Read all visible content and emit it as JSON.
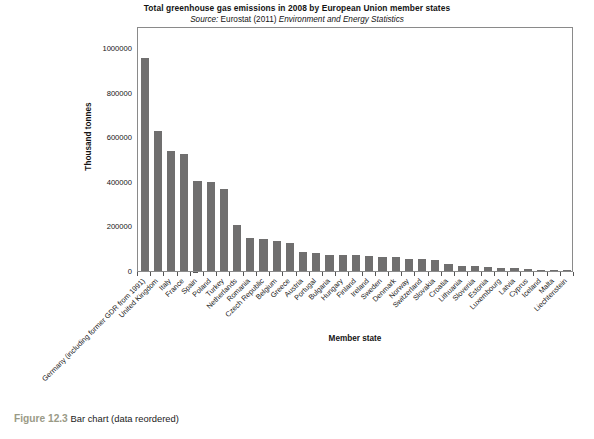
{
  "figure": {
    "caption_number": "Figure 12.3",
    "caption_text": "Bar chart (data reordered)"
  },
  "chart_data": {
    "type": "bar",
    "title": "Total greenhouse gas emissions in 2008 by European Union member states",
    "subtitle_prefix": "Source:",
    "subtitle_plain": " Eurostat (2011) ",
    "subtitle_italic": "Environment and Energy Statistics",
    "xlabel": "Member state",
    "ylabel": "Thousand tonnes",
    "ylim": [
      0,
      1100000
    ],
    "yticks": [
      0,
      200000,
      400000,
      600000,
      800000,
      1000000
    ],
    "ytick_labels": [
      "0",
      "200000",
      "400000",
      "600000",
      "800000",
      "1000000"
    ],
    "grid": false,
    "legend": null,
    "bar_color": "#706f6f",
    "categories": [
      "Germany (including former GDR from 1991)",
      "United Kingdom",
      "Italy",
      "France",
      "Spain",
      "Poland",
      "Turkey",
      "Netherlands",
      "Romania",
      "Czech Republic",
      "Belgium",
      "Greece",
      "Austria",
      "Portugal",
      "Bulgaria",
      "Hungary",
      "Finland",
      "Ireland",
      "Sweden",
      "Denmark",
      "Norway",
      "Switzerland",
      "Slovakia",
      "Croatia",
      "Lithuania",
      "Slovenia",
      "Estonia",
      "Luxembourg",
      "Latvia",
      "Cyprus",
      "Iceland",
      "Malta",
      "Liechtenstein"
    ],
    "values": [
      958000,
      628000,
      541000,
      527000,
      405000,
      398000,
      366000,
      207000,
      146000,
      142000,
      134000,
      127000,
      87000,
      79000,
      73000,
      73000,
      70000,
      68000,
      64000,
      64000,
      54000,
      53000,
      49000,
      31000,
      24000,
      21000,
      20000,
      12000,
      12000,
      10000,
      5000,
      3000,
      300
    ]
  }
}
